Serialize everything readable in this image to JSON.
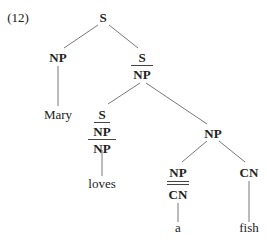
{
  "example_number": "(12)",
  "tree": {
    "root": {
      "label": "S"
    },
    "subject_np": {
      "label": "NP"
    },
    "subject_word": "Mary",
    "vp": {
      "numerator": "S",
      "denominator": "NP"
    },
    "verb": {
      "top": "S",
      "middle": "NP",
      "bottom": "NP"
    },
    "verb_word": "loves",
    "object_np": {
      "label": "NP"
    },
    "det": {
      "numerator": "NP",
      "denominator": "CN",
      "double_bar": true
    },
    "det_word": "a",
    "noun": {
      "label": "CN"
    },
    "noun_word": "fish"
  }
}
